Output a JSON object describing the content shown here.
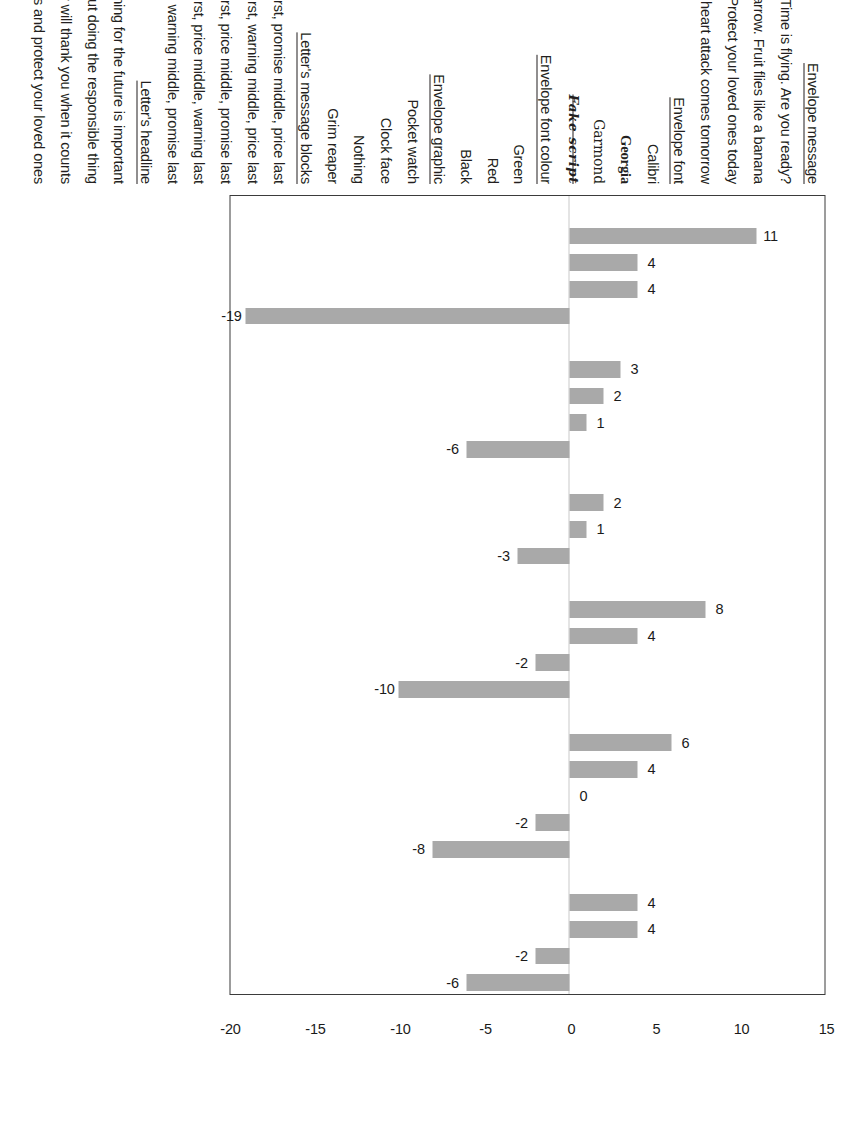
{
  "chart_data": {
    "type": "bar",
    "title": "",
    "xlabel": "",
    "ylabel": "",
    "orientation": "vertical",
    "ylim": [
      -20,
      15
    ],
    "grid": false,
    "legend": null,
    "axis_ticks": [
      "-20",
      "-15",
      "-10",
      "-5",
      "0",
      "5",
      "10",
      "15"
    ],
    "axis_tick_values": [
      -20,
      -15,
      -10,
      -5,
      0,
      5,
      10,
      15
    ],
    "bar_color": "#a9a9a9",
    "frame_color": "#3b3b3b",
    "groups": [
      {
        "header": "Envelope message",
        "items": [
          {
            "label": "Time is flying. Are you ready?",
            "value": 11,
            "value_label": "11",
            "style": "plain"
          },
          {
            "label": "Time flies like an arrow. Fruit flies like a banana",
            "value": 4,
            "value_label": "4",
            "style": "plain"
          },
          {
            "label": "Protect your loved ones today",
            "value": 4,
            "value_label": "4",
            "style": "plain"
          },
          {
            "label": "Your heart attack comes tomorrow",
            "value": -19,
            "value_label": "-19",
            "style": "plain"
          }
        ]
      },
      {
        "header": "Envelope font",
        "items": [
          {
            "label": "Calibri",
            "value": 3,
            "value_label": "3",
            "style": "calibri"
          },
          {
            "label": "Georgia",
            "value": 2,
            "value_label": "2",
            "style": "georgia"
          },
          {
            "label": "Garmond",
            "value": 1,
            "value_label": "1",
            "style": "garamond"
          },
          {
            "label": "Fake script",
            "value": -6,
            "value_label": "-6",
            "style": "script"
          }
        ]
      },
      {
        "header": "Envelope font colour",
        "items": [
          {
            "label": "Green",
            "value": 2,
            "value_label": "2",
            "style": "plain"
          },
          {
            "label": "Red",
            "value": 1,
            "value_label": "1",
            "style": "plain"
          },
          {
            "label": "Black",
            "value": -3,
            "value_label": "-3",
            "style": "plain"
          }
        ]
      },
      {
        "header": "Envelope graphic",
        "items": [
          {
            "label": "Pocket watch",
            "value": 8,
            "value_label": "8",
            "style": "plain"
          },
          {
            "label": "Clock face",
            "value": 4,
            "value_label": "4",
            "style": "plain"
          },
          {
            "label": "Nothing",
            "value": -2,
            "value_label": "-2",
            "style": "plain"
          },
          {
            "label": "Grim reaper",
            "value": -10,
            "value_label": "-10",
            "style": "plain"
          }
        ]
      },
      {
        "header": "Letter's message blocks",
        "items": [
          {
            "label": "Warning first, promise middle, price last",
            "value": 6,
            "value_label": "6",
            "style": "plain"
          },
          {
            "label": "Promise first, warning middle, price last",
            "value": 4,
            "value_label": "4",
            "style": "plain"
          },
          {
            "label": "Warning first, price middle, promise last",
            "value": 0,
            "value_label": "0",
            "style": "plain"
          },
          {
            "label": "Promise first, price middle, warning last",
            "value": -2,
            "value_label": "-2",
            "style": "plain"
          },
          {
            "label": "Price first, warning middle, promise last",
            "value": -8,
            "value_label": "-8",
            "style": "plain"
          }
        ]
      },
      {
        "header": "Letter's headline",
        "items": [
          {
            "label": "Why planning for the future is important",
            "value": 4,
            "value_label": "4",
            "style": "plain"
          },
          {
            "label": "About doing the responsible thing",
            "value": 4,
            "value_label": "4",
            "style": "plain"
          },
          {
            "label": "Your family will thank you when it counts",
            "value": -2,
            "value_label": "-2",
            "style": "plain"
          },
          {
            "label": "Stop finding excuses and protect your loved ones",
            "value": -6,
            "value_label": "-6",
            "style": "plain"
          }
        ]
      }
    ]
  }
}
